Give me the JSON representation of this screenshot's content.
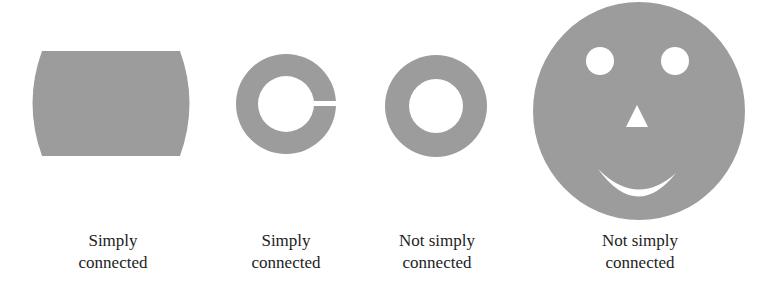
{
  "figure": {
    "fill_color": "#9c9c9c",
    "background": "#ffffff",
    "shapes": [
      {
        "id": "barrel",
        "kind": "region-no-holes",
        "label": [
          "Simply",
          "connected"
        ]
      },
      {
        "id": "slit-ring",
        "kind": "annulus-with-slit",
        "label": [
          "Simply",
          "connected"
        ]
      },
      {
        "id": "annulus",
        "kind": "annulus",
        "label": [
          "Not simply",
          "connected"
        ]
      },
      {
        "id": "smiley-face",
        "kind": "disk-with-four-holes",
        "label": [
          "Not simply",
          "connected"
        ]
      }
    ]
  }
}
